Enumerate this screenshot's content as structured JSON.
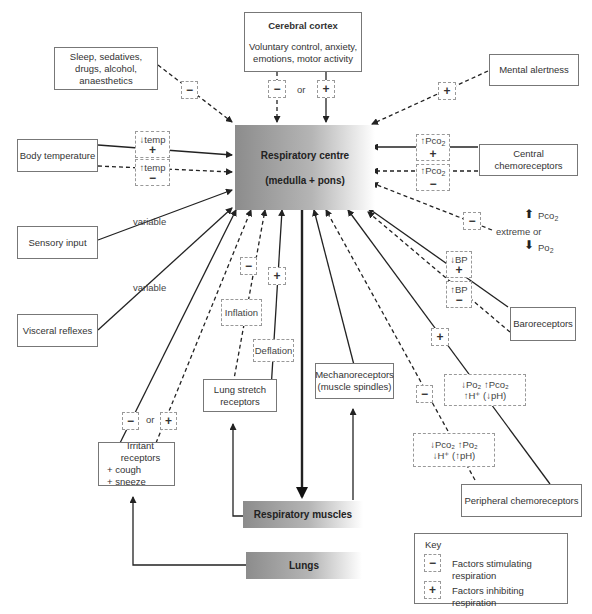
{
  "centre": {
    "title": "Respiratory centre",
    "subtitle": "(medulla + pons)"
  },
  "cortex": {
    "title": "Cerebral cortex",
    "line1": "Voluntary control, anxiety,",
    "line2": "emotions, motor activity",
    "or": "or",
    "minus": "−",
    "plus": "+"
  },
  "sleep": {
    "line1": "Sleep, sedatives,",
    "line2": "drugs, alcohol,",
    "line3": "anaesthetics",
    "sign": "−"
  },
  "mental": {
    "label": "Mental alertness",
    "sign": "+"
  },
  "body_temp": {
    "label": "Body temperature",
    "low_label": "↓temp",
    "low_sign": "+",
    "high_label": "↑temp",
    "high_sign": "−"
  },
  "central_chemo": {
    "label": "Central chemoreceptors",
    "up_label": "↑Pco",
    "up_sub": "2",
    "up_sign": "+",
    "up2_label": "↑Pco",
    "up2_sub": "2",
    "up2_sign": "−"
  },
  "extreme": {
    "sign": "−",
    "label": "extreme or",
    "pco2": "Pco",
    "po2": "Po",
    "sub": "2",
    "up_arrow": "⬆",
    "down_arrow": "⬇"
  },
  "sensory": {
    "label": "Sensory input",
    "variable": "variable"
  },
  "visceral": {
    "label": "Visceral reflexes",
    "variable": "variable"
  },
  "baro": {
    "label": "Baroreceptors",
    "low_label": "↓BP",
    "low_sign": "+",
    "high_label": "↑BP",
    "high_sign": "−"
  },
  "lung_stretch": {
    "line1": "Lung stretch",
    "line2": "receptors",
    "inflation": "Inflation",
    "deflation": "Deflation",
    "minus": "−",
    "plus": "+"
  },
  "mechano": {
    "line1": "Mechanoreceptors",
    "line2": "(muscle spindles)"
  },
  "irritant": {
    "line1": "Irritant receptors",
    "line2": "+ cough",
    "line3": "+ sneeze",
    "minus": "−",
    "or": "or",
    "plus": "+"
  },
  "peripheral": {
    "label": "Peripheral chemoreceptors",
    "plus": "+",
    "minus": "−",
    "stim_line1": "↓Po₂ ↑Pco₂",
    "stim_line2": "↑H⁺ (↓pH)",
    "inhib_line1": "↓Pco₂ ↑Po₂",
    "inhib_line2": "↓H⁺ (↑pH)"
  },
  "muscles": {
    "label": "Respiratory muscles"
  },
  "lungs": {
    "label": "Lungs"
  },
  "key": {
    "title": "Key",
    "minus": "−",
    "plus": "+",
    "stimulating": "Factors stimulating respiration",
    "inhibiting": "Factors inhibiting respiration"
  }
}
